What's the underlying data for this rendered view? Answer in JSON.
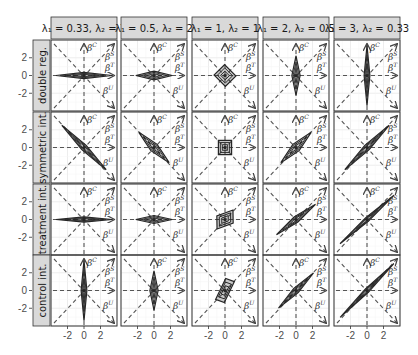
{
  "chart_data": {
    "type": "faceted-contour",
    "title": "",
    "xlabel": "",
    "ylabel": "",
    "xlim": [
      -4,
      4
    ],
    "ylim": [
      -4,
      4
    ],
    "x_ticks": [
      -2,
      0,
      2
    ],
    "y_ticks": [
      -2,
      0,
      2
    ],
    "x_tick_labels": [
      "-2",
      "0",
      "2"
    ],
    "y_tick_labels": [
      "-2",
      "0",
      "2"
    ],
    "grid": true,
    "column_facets": [
      {
        "label": "λ₁ = 0.33, λ₂ = 3",
        "lambda1": 0.33,
        "lambda2": 3
      },
      {
        "label": "λ₁ = 0.5, λ₂ = 2",
        "lambda1": 0.5,
        "lambda2": 2
      },
      {
        "label": "λ₁ = 1, λ₂ = 1",
        "lambda1": 1,
        "lambda2": 1
      },
      {
        "label": "λ₁ = 2, λ₂ = 0.5",
        "lambda1": 2,
        "lambda2": 0.5
      },
      {
        "label": "λ₁ = 3, λ₂ = 0.33",
        "lambda1": 3,
        "lambda2": 0.33
      }
    ],
    "row_facets": [
      {
        "label": "double reg."
      },
      {
        "label": "symmetric int."
      },
      {
        "label": "treatment int."
      },
      {
        "label": "control int."
      }
    ],
    "reference_axes": [
      {
        "name": "βC",
        "direction": "vertical (up)"
      },
      {
        "name": "βS",
        "direction": "diagonal (up-right)"
      },
      {
        "name": "βT",
        "direction": "horizontal (right)"
      },
      {
        "name": "βU",
        "direction": "diagonal (down-right)"
      }
    ],
    "panels": [
      [
        {
          "shape": "diamond",
          "half_x": 3.4,
          "half_y": 0.35,
          "angle": 0
        },
        {
          "shape": "diamond",
          "half_x": 2.2,
          "half_y": 0.5,
          "angle": 0
        },
        {
          "shape": "square",
          "half_x": 0.9,
          "half_y": 0.9,
          "angle": 45
        },
        {
          "shape": "diamond",
          "half_x": 0.5,
          "half_y": 2.2,
          "angle": 0
        },
        {
          "shape": "diamond",
          "half_x": 0.35,
          "half_y": 3.4,
          "angle": 0
        }
      ],
      [
        {
          "shape": "diamond",
          "half_x": 3.8,
          "half_y": 0.35,
          "angle": -45
        },
        {
          "shape": "diamond",
          "half_x": 2.6,
          "half_y": 0.5,
          "angle": -45
        },
        {
          "shape": "square",
          "half_x": 0.8,
          "half_y": 0.8,
          "angle": 0
        },
        {
          "shape": "diamond",
          "half_x": 2.6,
          "half_y": 0.5,
          "angle": 45
        },
        {
          "shape": "diamond",
          "half_x": 3.8,
          "half_y": 0.35,
          "angle": 45
        }
      ],
      [
        {
          "shape": "diamond",
          "half_x": 3.4,
          "half_y": 0.3,
          "angle": 0
        },
        {
          "shape": "diamond",
          "half_x": 2.2,
          "half_y": 0.45,
          "angle": 0
        },
        {
          "shape": "parallelogram",
          "half_x": 1.3,
          "half_y": 0.7,
          "angle": 20
        },
        {
          "shape": "diamond",
          "half_x": 3.0,
          "half_y": 0.35,
          "angle": 38
        },
        {
          "shape": "diamond",
          "half_x": 4.4,
          "half_y": 0.25,
          "angle": 42
        }
      ],
      [
        {
          "shape": "diamond",
          "half_x": 0.35,
          "half_y": 3.4,
          "angle": 0
        },
        {
          "shape": "diamond",
          "half_x": 0.5,
          "half_y": 2.2,
          "angle": 0
        },
        {
          "shape": "parallelogram",
          "half_x": 0.7,
          "half_y": 1.3,
          "angle": -20
        },
        {
          "shape": "diamond",
          "half_x": 3.0,
          "half_y": 0.35,
          "angle": 45
        },
        {
          "shape": "diamond",
          "half_x": 4.6,
          "half_y": 0.25,
          "angle": 45
        }
      ]
    ]
  },
  "colors": {
    "panel_border": "#333333",
    "strip_fill": "#d9d9d9",
    "strip_border": "#333333",
    "grid_major": "#ebebeb",
    "grid_minor": "#f5f5f5",
    "dashed": "#555555",
    "contour": "#262626",
    "tick_text": "#4d4d4d"
  }
}
